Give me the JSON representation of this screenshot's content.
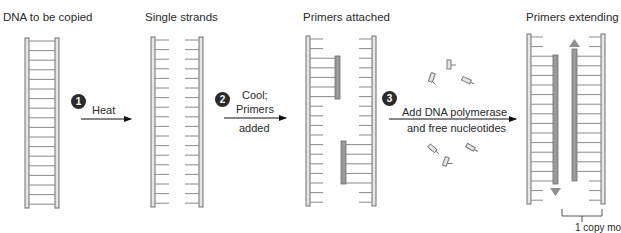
{
  "panels": [
    {
      "title": "DNA to be copied"
    },
    {
      "title": "Single strands"
    },
    {
      "title": "Primers attached"
    },
    {
      "title": "Primers extending"
    }
  ],
  "steps": [
    {
      "number": "1",
      "label_lines": [
        "Heat"
      ]
    },
    {
      "number": "2",
      "label_lines": [
        "Cool;",
        "Primers",
        "added"
      ]
    },
    {
      "number": "3",
      "label_lines": [
        "Add DNA polymerase",
        "and free nucleotides"
      ]
    }
  ],
  "bottom_label": "1 copy mo",
  "colors": {
    "strand_outline": "#6f6f6f",
    "strand_fill": "#e6e6e6",
    "rung": "#8a8a8a",
    "primer_fill": "#9a9a9a",
    "arrow": "#111111",
    "extend_arrow": "#8f8f8f",
    "step_circle": "#2b2b2b"
  }
}
